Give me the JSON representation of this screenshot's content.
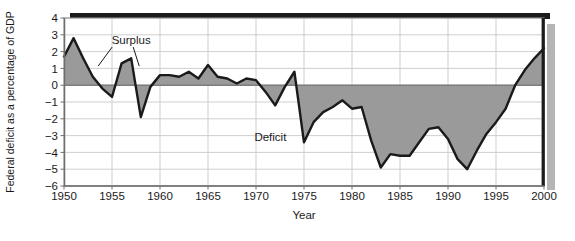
{
  "chart_data": {
    "type": "area",
    "title": "",
    "xlabel": "Year",
    "ylabel": "Federal deficit as a percentage of GDP",
    "xlim": [
      1950,
      2000
    ],
    "ylim": [
      -6,
      4
    ],
    "xticks": [
      1950,
      1955,
      1960,
      1965,
      1970,
      1975,
      1980,
      1985,
      1990,
      1995,
      2000
    ],
    "xtick_labels": [
      "1950",
      "1955",
      "1960",
      "1965",
      "1970",
      "1975",
      "1980",
      "1985",
      "1990",
      "1995",
      "2000"
    ],
    "yticks": [
      4,
      3,
      2,
      1,
      0,
      -1,
      -2,
      -3,
      -4,
      -5,
      -6
    ],
    "ytick_labels": [
      "4",
      "3",
      "2",
      "1",
      "0",
      "−1",
      "−2",
      "−3",
      "−4",
      "−5",
      "−6"
    ],
    "grid": true,
    "legend": "none",
    "zero_line": 0,
    "fill_color": "#9a9a9a",
    "line_color": "#1a1a1a",
    "grid_color": "#c9c9c9",
    "frame_color": "#8c8c8c",
    "background_color": "#ffffff",
    "annotations": [
      {
        "label": "Surplus",
        "x": 1957.0,
        "y": 2.45
      },
      {
        "label": "Deficit",
        "x": 1971.5,
        "y": -3.35
      }
    ],
    "x": [
      1950,
      1951,
      1952,
      1953,
      1954,
      1955,
      1956,
      1957,
      1958,
      1959,
      1960,
      1961,
      1962,
      1963,
      1964,
      1965,
      1966,
      1967,
      1968,
      1969,
      1970,
      1971,
      1972,
      1973,
      1974,
      1975,
      1976,
      1977,
      1978,
      1979,
      1980,
      1981,
      1982,
      1983,
      1984,
      1985,
      1986,
      1987,
      1988,
      1989,
      1990,
      1991,
      1992,
      1993,
      1994,
      1995,
      1996,
      1997,
      1998,
      1999,
      2000
    ],
    "values": [
      1.7,
      2.8,
      1.6,
      0.5,
      -0.2,
      -0.7,
      1.3,
      1.6,
      -1.9,
      -0.1,
      0.6,
      0.6,
      0.5,
      0.8,
      0.4,
      1.2,
      0.5,
      0.4,
      0.1,
      0.4,
      0.3,
      -0.4,
      -1.2,
      -0.1,
      0.8,
      -3.4,
      -2.2,
      -1.6,
      -1.3,
      -0.9,
      -1.4,
      -1.3,
      -3.3,
      -4.9,
      -4.1,
      -4.2,
      -4.2,
      -3.4,
      -2.6,
      -2.5,
      -3.2,
      -4.4,
      -5.0,
      -3.9,
      -2.9,
      -2.2,
      -1.4,
      0.0,
      0.9,
      1.6,
      2.2
    ]
  },
  "axis_labels": {
    "x_axis_title": "Year",
    "y_axis_title": "Federal deficit as a percentage of GDP"
  }
}
